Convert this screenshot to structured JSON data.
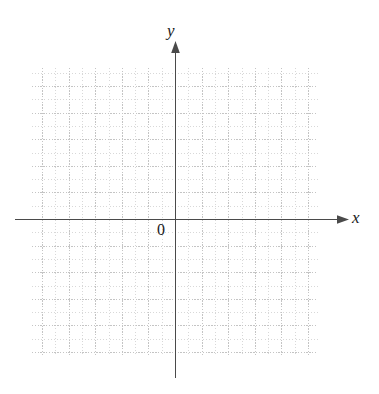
{
  "figure": {
    "kind": "blank-cartesian-grid",
    "width": 379,
    "height": 394,
    "background_color": "#ffffff"
  },
  "labels": {
    "y_axis": "y",
    "x_axis": "x",
    "origin": "0"
  },
  "colors": {
    "axis": "#4a4a4a",
    "grid_minor": "#d8d8d8",
    "grid_major": "#c4c4c4",
    "label": "#1a1a1a",
    "background": "#ffffff"
  },
  "chart_data": {
    "type": "scatter",
    "title": "",
    "subtitle": "",
    "xlabel": "x",
    "ylabel": "y",
    "origin_label": "0",
    "series": [
      {
        "name": "",
        "x": [],
        "y": []
      }
    ],
    "grid": true,
    "grid_style": "dotted",
    "legend": null,
    "annotations": [],
    "axis_arrows": {
      "x_positive": true,
      "y_positive": true
    },
    "tick_labels": {
      "x": [],
      "y": []
    },
    "xlim": [
      -10.75,
      10.75
    ],
    "ylim": [
      -10.3,
      11.35
    ],
    "minor_step": 1,
    "major_step": 2,
    "note": "Empty coordinate plane: dotted graph-paper grid with unlabeled unit cells; no data plotted."
  },
  "geometry": {
    "grid_left": 32,
    "grid_right": 318,
    "grid_top": 68,
    "grid_bottom": 356,
    "origin_x": 175,
    "origin_y": 219,
    "cell": 13.3,
    "major_every": 2,
    "x_axis_start": 15,
    "x_axis_end": 343,
    "y_axis_top": 47,
    "y_axis_bottom": 378
  }
}
